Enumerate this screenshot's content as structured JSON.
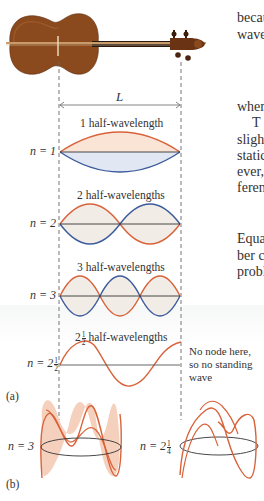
{
  "side_text": {
    "lines": [
      {
        "text": "becau",
        "top": 11,
        "left": 237
      },
      {
        "text": "wave",
        "top": 28,
        "left": 237
      },
      {
        "text": "wher",
        "top": 100,
        "left": 237
      },
      {
        "text": "T",
        "top": 116,
        "left": 252
      },
      {
        "text": "slight",
        "top": 133,
        "left": 237
      },
      {
        "text": "static",
        "top": 149,
        "left": 237
      },
      {
        "text": "ever,",
        "top": 165,
        "left": 237
      },
      {
        "text": "feren",
        "top": 181,
        "left": 237
      },
      {
        "text": "Equa",
        "top": 232,
        "left": 237
      },
      {
        "text": "ber c",
        "top": 249,
        "left": 237
      },
      {
        "text": "probl",
        "top": 265,
        "left": 237
      }
    ]
  },
  "figure": {
    "length_label": "L",
    "panel_a_label": "(a)",
    "panel_b_label": "(b)",
    "modes": [
      {
        "n_label": "n = 1",
        "caption": "1 half-wavelength",
        "half_wavelengths": 1
      },
      {
        "n_label": "n = 2",
        "caption": "2 half-wavelengths",
        "half_wavelengths": 2
      },
      {
        "n_label": "n = 3",
        "caption": "3 half-wavelengths",
        "half_wavelengths": 3
      },
      {
        "n_label_prefix": "n = 2",
        "n_label_frac_num": "1",
        "n_label_frac_den": "2",
        "caption_prefix": "2",
        "caption_frac_num": "1",
        "caption_frac_den": "2",
        "caption_suffix": "half-wavelengths",
        "half_wavelengths": 2.5
      }
    ],
    "note": {
      "line1": "No node here,",
      "line2": "so no standing",
      "line3": "wave"
    },
    "ring_modes": [
      {
        "n_label": "n = 3"
      },
      {
        "n_label_prefix": "n = 2",
        "frac_num": "1",
        "frac_den": "4"
      }
    ],
    "colors": {
      "orange": "#d9623a",
      "orange_fill": "#f6d9c8",
      "blue": "#3b5b9c",
      "blue_fill": "#d9e1ef",
      "axis": "#333333",
      "dash": "#666666"
    }
  }
}
